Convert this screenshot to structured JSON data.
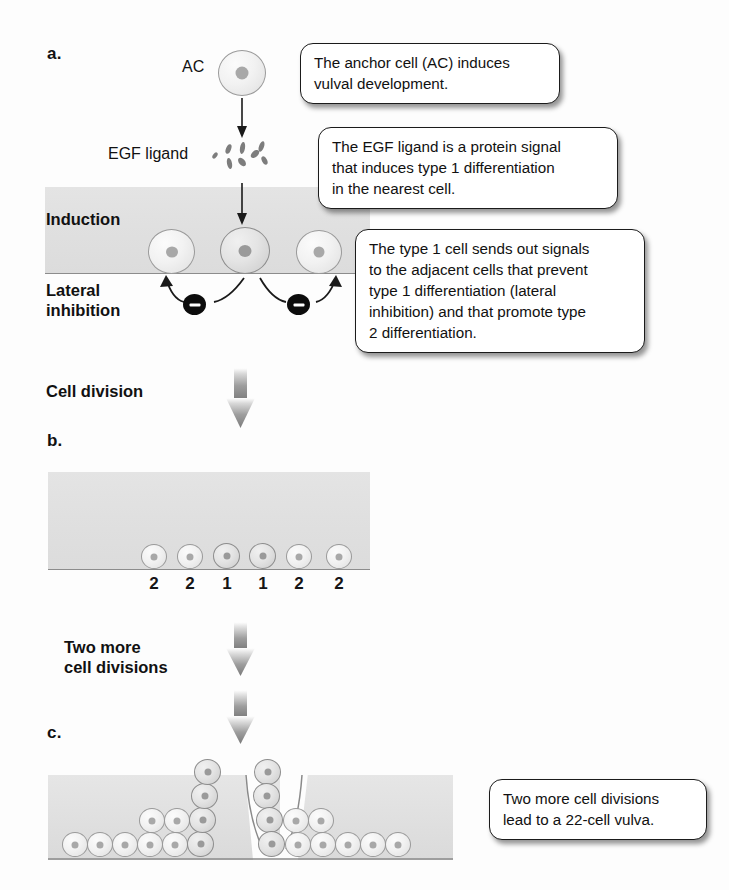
{
  "panels": [
    {
      "id": "a",
      "label": "a."
    },
    {
      "id": "b",
      "label": "b."
    },
    {
      "id": "c",
      "label": "c."
    }
  ],
  "labels": {
    "anchor_cell": "AC",
    "egf_ligand": "EGF ligand",
    "induction": "Induction",
    "lateral_inhibition_line1": "Lateral",
    "lateral_inhibition_line2": "inhibition",
    "cell_division": "Cell division",
    "two_more_line1": "Two more",
    "two_more_line2": "cell divisions"
  },
  "callouts": [
    {
      "id": "anchor-cell-callout",
      "lines": [
        "The anchor cell (AC) induces",
        "vulval development."
      ]
    },
    {
      "id": "egf-ligand-callout",
      "lines": [
        "The EGF ligand is a protein signal",
        "that induces type 1 differentiation",
        "in the nearest cell."
      ]
    },
    {
      "id": "lateral-inhibition-callout",
      "lines": [
        "The type 1 cell sends out signals",
        "to the adjacent cells that prevent",
        "type 1 differentiation (lateral",
        "inhibition) and that promote type",
        "2 differentiation."
      ]
    },
    {
      "id": "vulva-result-callout",
      "lines": [
        "Two more cell divisions",
        "lead to a 22-cell vulva."
      ]
    }
  ],
  "panel_b": {
    "cell_types": [
      "2",
      "2",
      "1",
      "1",
      "2",
      "2"
    ],
    "cell_count": 6
  },
  "panel_c": {
    "total_cells": 22,
    "description": "22-cell vulva formed by invagination"
  },
  "panel_a": {
    "induction_cell_count": 3,
    "inhibition_badge_count": 2,
    "inhibition_symbol": "minus",
    "ligand_particle_count": 8
  },
  "colors": {
    "tissue_gray": "#e0e0e0",
    "cell_outline": "#9a9a9a",
    "nucleus": "#a8a8a8",
    "inhibition_black": "#0c0c0c",
    "arrow_gray": "#8a8a8a",
    "text": "#111111"
  }
}
